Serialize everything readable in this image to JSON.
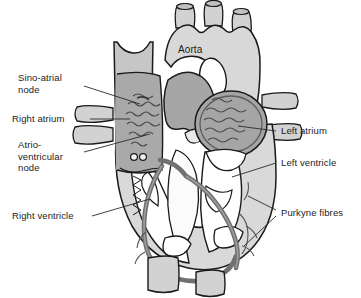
{
  "figure": {
    "background": "#ffffff"
  },
  "palette": {
    "outline": "#1a1a1a",
    "myocardium": "#d7d7d7",
    "vessel_light": "#d2d2d2",
    "atrium_mid": "#a8a8a8",
    "chamber_white": "#ffffff",
    "conduction_dark": "#6e6e6e",
    "fibre_line": "#555555",
    "label_text": "#1c1c1c",
    "leader_line": "#2a2a2a"
  },
  "labels": {
    "aorta": "Aorta",
    "sino_atrial_node": "Sino-atrial\nnode",
    "right_atrium": "Right atrium",
    "atrio_ventricular_node": "Atrio-\nventricular\nnode",
    "right_ventricle": "Right ventricle",
    "left_atrium": "Left atrium",
    "left_ventricle": "Left ventricle",
    "purkyne_fibres": "Purkyne fibres"
  },
  "structures": [
    {
      "name": "aorta",
      "side": "top",
      "shading": "light"
    },
    {
      "name": "superior-vena-cava",
      "side": "left",
      "shading": "light"
    },
    {
      "name": "pulmonary-artery",
      "side": "center",
      "shading": "mid"
    },
    {
      "name": "right-atrium",
      "side": "left",
      "shading": "mid"
    },
    {
      "name": "left-atrium",
      "side": "right",
      "shading": "mid"
    },
    {
      "name": "right-ventricle",
      "side": "left",
      "shading": "white"
    },
    {
      "name": "left-ventricle",
      "side": "right",
      "shading": "white"
    },
    {
      "name": "sino-atrial-node",
      "side": "left",
      "shading": "fibres"
    },
    {
      "name": "atrio-ventricular-node",
      "side": "center",
      "shading": "fibres"
    },
    {
      "name": "purkyne-fibres",
      "side": "both",
      "shading": "dark"
    }
  ]
}
